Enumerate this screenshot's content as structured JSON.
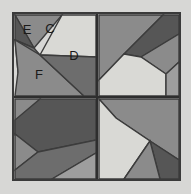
{
  "figure": {
    "name": "quilt-block-diagram",
    "background_color": "#d7d7d5",
    "frame": {
      "x": 13,
      "y": 13,
      "width": 167,
      "height": 167,
      "border_color": "#3a3a3a",
      "border_width": 2
    },
    "divider": {
      "color": "#2e2e2e",
      "width": 2,
      "center_x": 97,
      "center_y": 97
    },
    "palette": {
      "dark": "#565656",
      "dark_mid": "#6d6d6d",
      "mid": "#8b8b8b",
      "mid_light": "#9e9e9e",
      "light": "#b4b4b2",
      "very_light": "#d9d9d5",
      "outline": "#3c3c3c"
    },
    "labels": [
      {
        "id": "label-e",
        "text": "E",
        "x": 27,
        "y": 34
      },
      {
        "id": "label-c",
        "text": "C",
        "x": 50,
        "y": 33
      },
      {
        "id": "label-d",
        "text": "D",
        "x": 74,
        "y": 60
      },
      {
        "id": "label-f",
        "text": "F",
        "x": 39,
        "y": 79
      }
    ],
    "quadrants": [
      {
        "id": "quadrant-top-left",
        "name": "top-left",
        "pieces": [
          {
            "id": "tl-p1",
            "fill": "#8b8b8b",
            "points": "15,15 62,15 34,48"
          },
          {
            "id": "tl-p2",
            "fill": "#565656",
            "points": "15,15 34,48 15,40"
          },
          {
            "id": "tl-p3",
            "fill": "#6d6d6d",
            "points": "15,40 34,48 40,55 18,72"
          },
          {
            "id": "tl-p4",
            "fill": "#d9d9d5",
            "points": "62,15 96,15 96,57 40,55"
          },
          {
            "id": "tl-p5",
            "fill": "#8b8b8b",
            "points": "15,40 18,72 15,96 84,96 40,55"
          },
          {
            "id": "tl-p6",
            "fill": "#6d6d6d",
            "points": "40,55 96,57 96,96 84,96"
          }
        ]
      },
      {
        "id": "quadrant-top-right",
        "name": "top-right",
        "pieces": [
          {
            "id": "tr-p1",
            "fill": "#8b8b8b",
            "points": "99,15 163,15 124,54 99,80"
          },
          {
            "id": "tr-p2",
            "fill": "#565656",
            "points": "163,15 179,15 179,34 141,57 124,54"
          },
          {
            "id": "tr-p3",
            "fill": "#8b8b8b",
            "points": "141,57 179,34 179,62 166,74"
          },
          {
            "id": "tr-p4",
            "fill": "#d9d9d5",
            "points": "124,54 141,57 166,74 166,96 99,96 99,80"
          },
          {
            "id": "tr-p5",
            "fill": "#9e9e9e",
            "points": "166,74 179,62 179,96 166,96"
          }
        ]
      },
      {
        "id": "quadrant-bottom-left",
        "name": "bottom-left",
        "pieces": [
          {
            "id": "bl-p1",
            "fill": "#8b8b8b",
            "points": "15,99 40,99 15,134"
          },
          {
            "id": "bl-p2",
            "fill": "#565656",
            "points": "40,99 96,99 96,140 38,152 15,134 15,120"
          },
          {
            "id": "bl-p3",
            "fill": "#8b8b8b",
            "points": "15,134 38,152 15,170"
          },
          {
            "id": "bl-p4",
            "fill": "#6d6d6d",
            "points": "15,170 38,152 96,140 96,153 52,179 15,179"
          },
          {
            "id": "bl-p5",
            "fill": "#9e9e9e",
            "points": "96,153 96,179 52,179"
          }
        ]
      },
      {
        "id": "quadrant-bottom-right",
        "name": "bottom-right",
        "pieces": [
          {
            "id": "br-p1",
            "fill": "#8b8b8b",
            "points": "99,99 179,99 179,160 150,141 116,118"
          },
          {
            "id": "br-p2",
            "fill": "#d9d9d5",
            "points": "99,99 116,118 150,141 124,179 99,179"
          },
          {
            "id": "br-p3",
            "fill": "#565656",
            "points": "150,141 179,160 179,179 160,179"
          },
          {
            "id": "br-p4",
            "fill": "#8b8b8b",
            "points": "150,141 160,179 124,179"
          }
        ]
      }
    ]
  }
}
